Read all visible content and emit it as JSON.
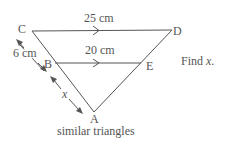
{
  "diagram": {
    "type": "similar-triangles",
    "caption": "similar triangles",
    "instruction": "Find x.",
    "points": {
      "A": {
        "label": "A",
        "x": 94,
        "y": 112
      },
      "B": {
        "label": "B",
        "x": 55,
        "y": 63
      },
      "C": {
        "label": "C",
        "x": 32,
        "y": 31
      },
      "D": {
        "label": "D",
        "x": 172,
        "y": 30
      },
      "E": {
        "label": "E",
        "x": 141,
        "y": 63
      }
    },
    "segments": [
      {
        "from": "C",
        "to": "D",
        "label": "25 cm",
        "parallel_marker": true
      },
      {
        "from": "B",
        "to": "E",
        "label": "20 cm",
        "parallel_marker": true
      },
      {
        "from": "C",
        "to": "A"
      },
      {
        "from": "D",
        "to": "A"
      }
    ],
    "dimensions": [
      {
        "from": "C",
        "to": "B",
        "label": "6 cm"
      },
      {
        "from": "B",
        "to": "A",
        "label": "x"
      }
    ],
    "labels": {
      "top_length": "25 cm",
      "mid_length": "20 cm",
      "cb_length": "6 cm",
      "ba_length": "x"
    },
    "colors": {
      "line": "#555555",
      "text": "#555555",
      "background": "#ffffff"
    }
  }
}
